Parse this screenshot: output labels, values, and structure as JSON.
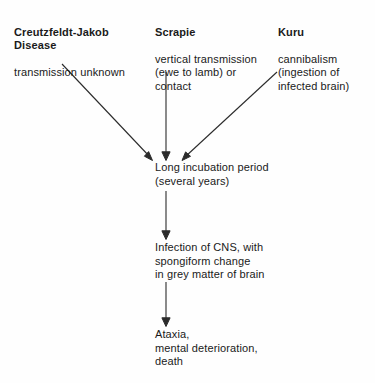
{
  "diagram": {
    "ink_color": "#2b2b2b",
    "background_color": "#fefefe",
    "sources": [
      {
        "id": "cjd",
        "heading": "Creutzfeldt-Jakob\nDisease",
        "body": "transmission unknown"
      },
      {
        "id": "scrapie",
        "heading": "Scrapie",
        "body": "vertical transmission\n(ewe to lamb) or\ncontact"
      },
      {
        "id": "kuru",
        "heading": "Kuru",
        "body": "cannibalism\n(ingestion of\ninfected brain)"
      }
    ],
    "stages": [
      {
        "id": "incubation",
        "text": "Long incubation period\n(several years)"
      },
      {
        "id": "cns-infection",
        "text": "Infection of CNS, with\nspongiform change\nin grey matter of brain"
      },
      {
        "id": "outcome",
        "text": "Ataxia,\nmental deterioration,\ndeath"
      }
    ],
    "arrows": [
      {
        "id": "cjd-to-incubation",
        "from": "cjd",
        "to": "incubation",
        "style": "diagonal"
      },
      {
        "id": "scrapie-to-incubation",
        "from": "scrapie",
        "to": "incubation",
        "style": "vertical"
      },
      {
        "id": "kuru-to-incubation",
        "from": "kuru",
        "to": "incubation",
        "style": "diagonal"
      },
      {
        "id": "incubation-to-cns",
        "from": "incubation",
        "to": "cns-infection",
        "style": "vertical"
      },
      {
        "id": "cns-to-outcome",
        "from": "cns-infection",
        "to": "outcome",
        "style": "vertical"
      }
    ]
  }
}
